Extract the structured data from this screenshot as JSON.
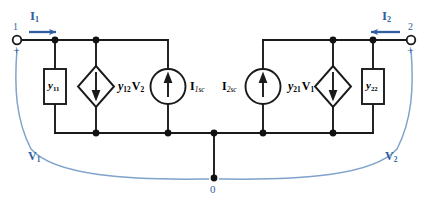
{
  "figure": {
    "type": "circuit-diagram",
    "colors": {
      "wire": "#1a1a1a",
      "label_black": "#000000",
      "annotation_blue": "#2f5fa0",
      "background": "#ffffff"
    }
  },
  "terminals": {
    "left": {
      "number": "1",
      "polarity": "+",
      "current_label": "I",
      "current_sub": "1",
      "current_direction": "right-into-circuit"
    },
    "right": {
      "number": "2",
      "polarity": "+",
      "current_label": "I",
      "current_sub": "2",
      "current_direction": "left-into-circuit"
    }
  },
  "components": [
    {
      "id": "y11",
      "kind": "admittance-box",
      "label": "y",
      "sub": "11",
      "label_side": "inside"
    },
    {
      "id": "y12v2",
      "kind": "dependent-current-source-diamond",
      "arrow": "down",
      "label": "y",
      "sub": "12",
      "label2": "V",
      "sub2": "2",
      "label_side": "right"
    },
    {
      "id": "i1sc",
      "kind": "independent-current-source-circle",
      "arrow": "up",
      "label": "I",
      "sub": "1sc",
      "label_side": "right"
    },
    {
      "id": "i2sc",
      "kind": "independent-current-source-circle",
      "arrow": "up",
      "label": "I",
      "sub": "2sc",
      "label_side": "left"
    },
    {
      "id": "y21v1",
      "kind": "dependent-current-source-diamond",
      "arrow": "down",
      "label": "y",
      "sub": "21",
      "label2": "V",
      "sub2": "1",
      "label_side": "left"
    },
    {
      "id": "y22",
      "kind": "admittance-box",
      "label": "y",
      "sub": "22",
      "label_side": "inside"
    }
  ],
  "voltages": {
    "v1": {
      "label": "V",
      "sub": "1"
    },
    "v2": {
      "label": "V",
      "sub": "2"
    }
  },
  "ground": {
    "label": "0"
  }
}
